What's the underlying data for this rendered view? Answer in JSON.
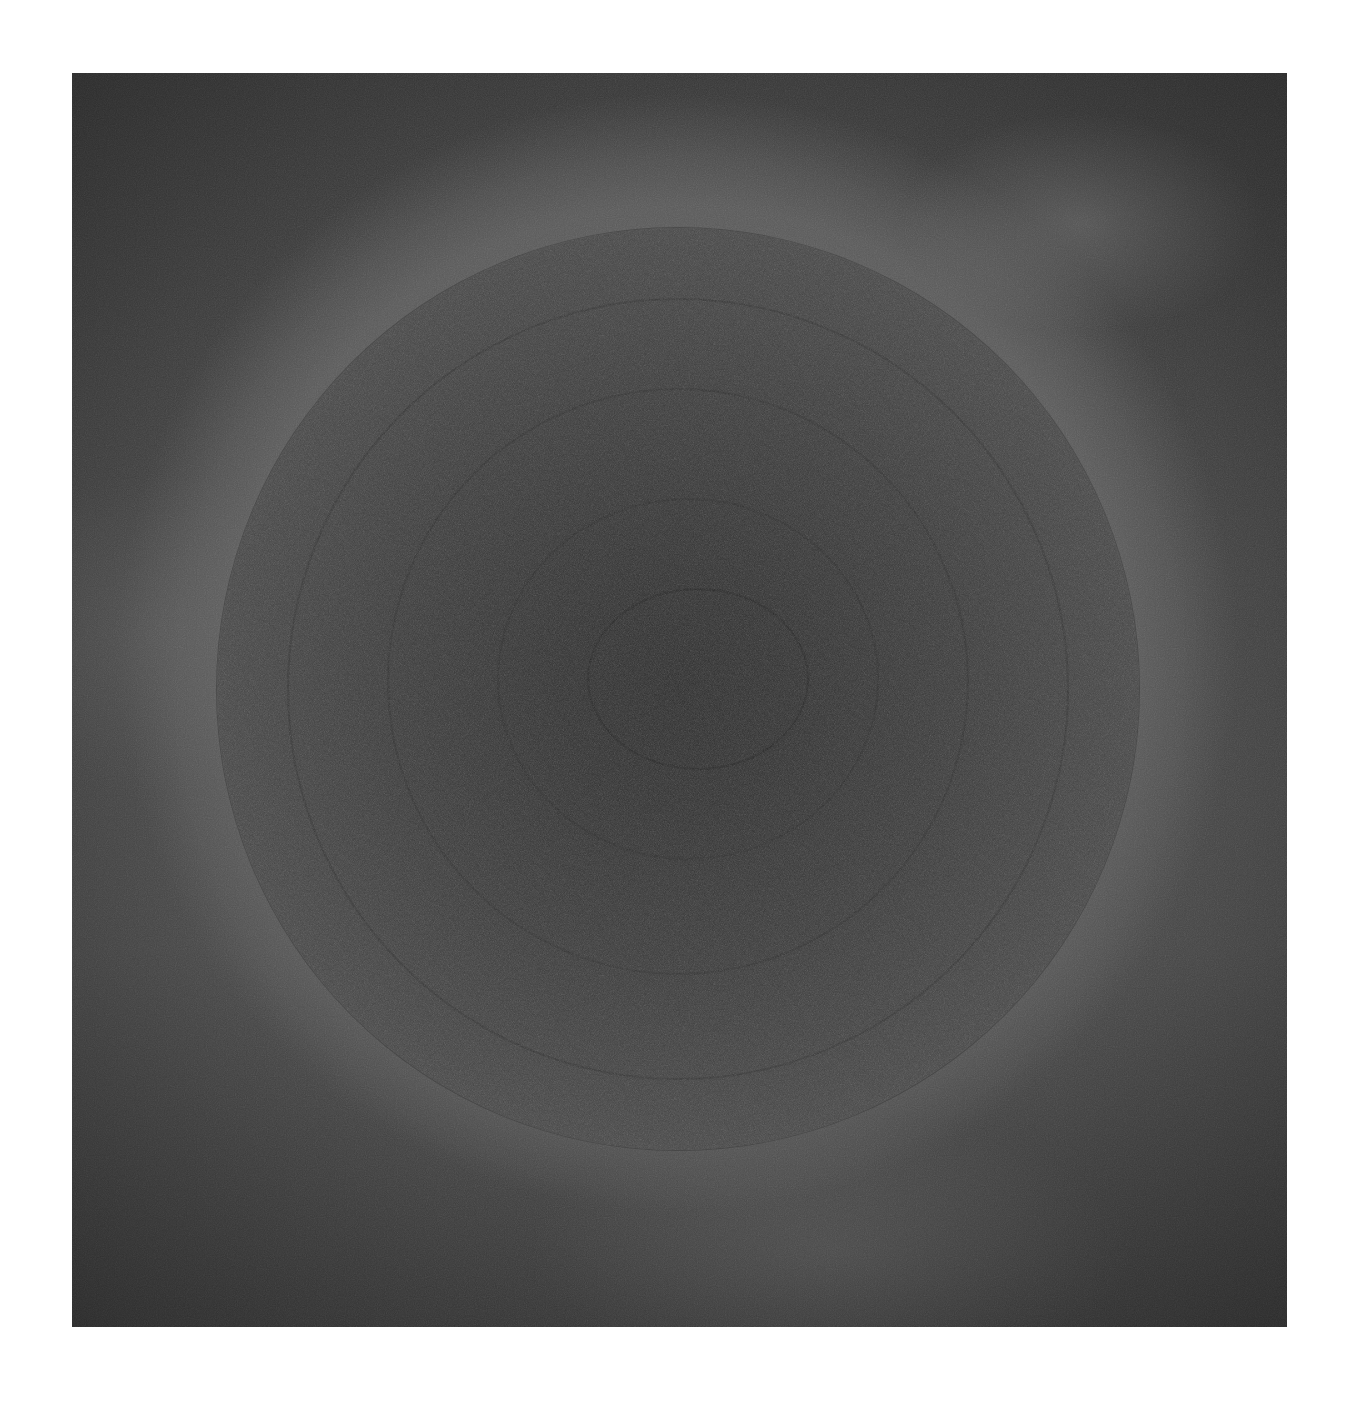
{
  "artwork": {
    "description": "Abstract dark gray square with a large textured concentric circle",
    "colors": {
      "page_background": "#ffffff",
      "field_dark": "#3a3a3a",
      "field_light_glow": "#6e6e6e",
      "disc_outer": "#505050",
      "disc_center": "#2f2f2f"
    }
  }
}
